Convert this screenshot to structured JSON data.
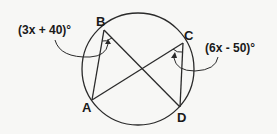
{
  "diagram": {
    "points": {
      "A": {
        "label": "A",
        "x": 92,
        "y": 100
      },
      "B": {
        "label": "B",
        "x": 104,
        "y": 30
      },
      "C": {
        "label": "C",
        "x": 183,
        "y": 43
      },
      "D": {
        "label": "D",
        "x": 180,
        "y": 107
      }
    },
    "circle": {
      "cx": 138,
      "cy": 69,
      "r": 56
    },
    "angles": {
      "B": {
        "expression": "(3x + 40)°",
        "vertex": "B",
        "between": [
          "A",
          "D"
        ]
      },
      "C": {
        "expression": "(6x - 50)°",
        "vertex": "C",
        "between": [
          "A",
          "D"
        ]
      }
    },
    "segments": [
      "BA",
      "BD",
      "CA",
      "CD"
    ],
    "colors": {
      "stroke": "#2a2a2a",
      "background": "#f7f7f5"
    }
  }
}
